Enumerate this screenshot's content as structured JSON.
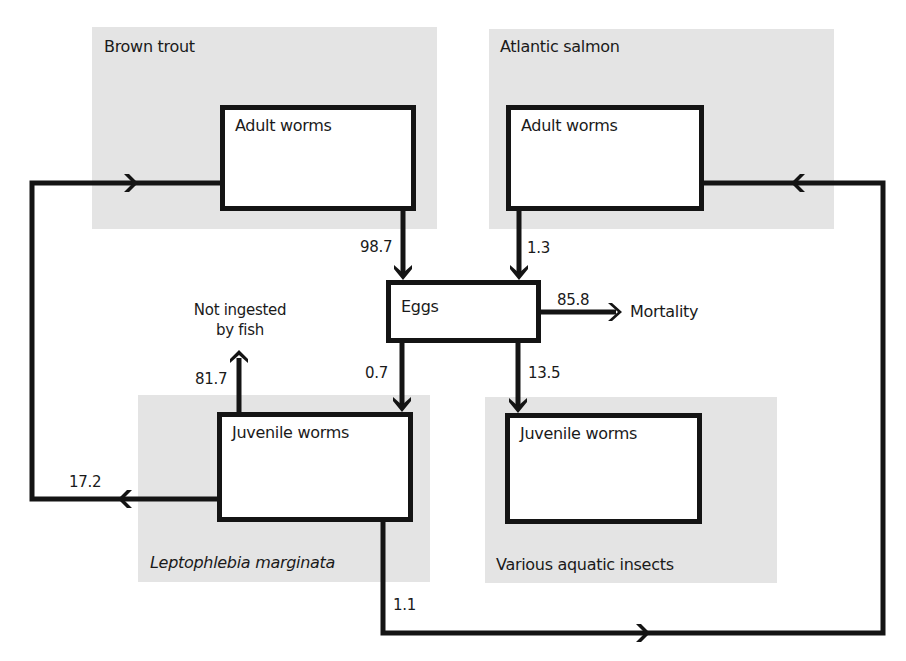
{
  "diagram": {
    "panels": [
      {
        "id": "brown-trout",
        "label": "Brown trout",
        "italic": false
      },
      {
        "id": "atlantic-salmon",
        "label": "Atlantic salmon",
        "italic": false
      },
      {
        "id": "leptophlebia",
        "label": "Leptophlebia marginata",
        "italic": true
      },
      {
        "id": "aquatic-insects",
        "label": "Various aquatic insects",
        "italic": false
      }
    ],
    "nodes": {
      "bt_adult": {
        "label": "Adult worms",
        "panel": "brown-trout"
      },
      "as_adult": {
        "label": "Adult worms",
        "panel": "atlantic-salmon"
      },
      "eggs": {
        "label": "Eggs"
      },
      "lm_juvenile": {
        "label": "Juvenile worms",
        "panel": "leptophlebia"
      },
      "ai_juvenile": {
        "label": "Juvenile worms",
        "panel": "aquatic-insects"
      }
    },
    "outcomes": {
      "not_ingested": "Not ingested by fish",
      "not_ingested_line1": "Not ingested",
      "not_ingested_line2": "by fish",
      "mortality": "Mortality"
    },
    "edges": [
      {
        "from": "bt_adult",
        "to": "eggs",
        "value": "98.7"
      },
      {
        "from": "as_adult",
        "to": "eggs",
        "value": "1.3"
      },
      {
        "from": "eggs",
        "to": "mortality",
        "value": "85.8"
      },
      {
        "from": "eggs",
        "to": "lm_juvenile",
        "value": "0.7"
      },
      {
        "from": "eggs",
        "to": "ai_juvenile",
        "value": "13.5"
      },
      {
        "from": "lm_juvenile",
        "to": "not_ingested",
        "value": "81.7"
      },
      {
        "from": "lm_juvenile",
        "to": "bt_adult",
        "value": "17.2"
      },
      {
        "from": "lm_juvenile",
        "to": "as_adult",
        "value": "1.1"
      }
    ],
    "colors": {
      "panel_bg": "#e4e4e4",
      "stroke": "#141414",
      "box_bg": "#ffffff"
    }
  }
}
